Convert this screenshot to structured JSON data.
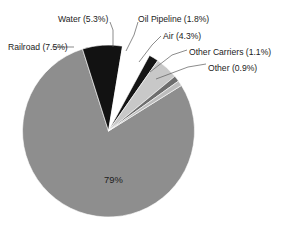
{
  "chart_data": {
    "type": "pie",
    "title": "",
    "subtitle": "",
    "xlabel": "",
    "ylabel": "",
    "legend_position": "callout-labels",
    "grid": false,
    "categories": [
      "Truck",
      "Railroad",
      "Water",
      "Oil Pipeline",
      "Air",
      "Other Carriers",
      "Other"
    ],
    "values": [
      79.0,
      7.5,
      5.3,
      1.8,
      4.3,
      1.1,
      0.9
    ],
    "slices": [
      {
        "name": "truck-slice",
        "label": "79%",
        "label_text": "79%",
        "value": 79.0,
        "percent_text": "79%",
        "color": "#8e8e8e",
        "label_placement": "inside",
        "label_x": 104,
        "label_y": 176,
        "start_angle": 58.0,
        "end_angle": 342.4
      },
      {
        "name": "railroad-slice",
        "label": "Railroad (7.5%)",
        "label_text": "Railroad (7.5%)",
        "value": 7.5,
        "percent_text": "7.5%",
        "color": "#121212",
        "label_placement": "callout",
        "label_x": 8,
        "label_y": 44,
        "label_anchor": "start",
        "leader": [
          [
            74,
            47
          ],
          [
            64,
            47
          ],
          [
            52,
            47
          ]
        ],
        "start_angle": 342.4,
        "end_angle": 369.4
      },
      {
        "name": "water-slice",
        "label": "Water (5.3%)",
        "label_text": "Water (5.3%)",
        "value": 5.3,
        "percent_text": "5.3%",
        "color": "#ffffff",
        "label_placement": "callout",
        "label_x": 58,
        "label_y": 16,
        "label_anchor": "start",
        "leader": [
          [
            113,
            47
          ],
          [
            113,
            30
          ],
          [
            110,
            22
          ]
        ],
        "start_angle": 369.4,
        "end_angle": 388.5
      },
      {
        "name": "oil-pipeline-slice",
        "label": "Oil Pipeline (1.8%)",
        "label_text": "Oil Pipeline (1.8%)",
        "value": 1.8,
        "percent_text": "1.8%",
        "color": "#151515",
        "label_placement": "callout",
        "label_x": 138,
        "label_y": 16,
        "label_anchor": "start",
        "leader": [
          [
            126,
            51
          ],
          [
            134,
            35
          ],
          [
            138,
            22
          ]
        ],
        "start_angle": 388.5,
        "end_angle": 395.0
      },
      {
        "name": "air-slice",
        "label": "Air (4.3%)",
        "label_text": "Air (4.3%)",
        "value": 4.3,
        "percent_text": "4.3%",
        "color": "#c8c8c8",
        "label_placement": "callout",
        "label_x": 163,
        "label_y": 33,
        "label_anchor": "start",
        "leader": [
          [
            139,
            62
          ],
          [
            152,
            45
          ],
          [
            161,
            36
          ]
        ],
        "start_angle": 395.0,
        "end_angle": 410.5
      },
      {
        "name": "other-carriers-slice",
        "label": "Other Carriers (1.1%)",
        "label_text": "Other Carriers (1.1%)",
        "value": 1.1,
        "percent_text": "1.1%",
        "color": "#6e6e6e",
        "label_placement": "callout",
        "label_x": 189,
        "label_y": 49,
        "label_anchor": "start",
        "leader": [
          [
            150,
            72
          ],
          [
            172,
            55
          ],
          [
            187,
            50
          ]
        ],
        "start_angle": 410.5,
        "end_angle": 414.5
      },
      {
        "name": "other-slice",
        "label": "Other (0.9%)",
        "label_text": "Other (0.9%)",
        "value": 0.9,
        "percent_text": "0.9%",
        "color": "#bdbdbd",
        "label_placement": "callout",
        "label_x": 208,
        "label_y": 65,
        "label_anchor": "start",
        "leader": [
          [
            156,
            79
          ],
          [
            188,
            67
          ],
          [
            206,
            64
          ]
        ],
        "start_angle": 414.5,
        "end_angle": 418.0
      }
    ],
    "geometry": {
      "center_x": 108.5,
      "center_y": 131,
      "radius": 86
    },
    "colors": {
      "truck": "#8e8e8e",
      "railroad": "#121212",
      "water": "#ffffff",
      "oil_pipeline": "#151515",
      "air": "#c8c8c8",
      "other_carriers": "#6e6e6e",
      "other": "#bdbdbd",
      "outline": "#5a5a5a",
      "text": "#1c1c1c",
      "background": "#ffffff"
    }
  }
}
